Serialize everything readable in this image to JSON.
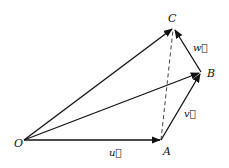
{
  "diagram": {
    "title": "",
    "points": {
      "O": {
        "label": "O",
        "x": 24,
        "y": 140
      },
      "A": {
        "label": "A",
        "x": 161,
        "y": 140
      },
      "B": {
        "label": "B",
        "x": 201,
        "y": 72
      },
      "C": {
        "label": "C",
        "x": 174,
        "y": 28
      }
    },
    "vectors": {
      "u": {
        "label": "u⃗",
        "from": "O",
        "to": "A"
      },
      "v": {
        "label": "v⃗",
        "from": "A",
        "to": "B"
      },
      "w": {
        "label": "w⃗",
        "from": "B",
        "to": "C"
      },
      "OB": {
        "from": "O",
        "to": "B"
      },
      "OC": {
        "from": "O",
        "to": "C"
      }
    },
    "dashed": {
      "from": "A",
      "to": "C"
    },
    "colors": {
      "stroke": "#111111",
      "background": "#ffffff"
    }
  }
}
